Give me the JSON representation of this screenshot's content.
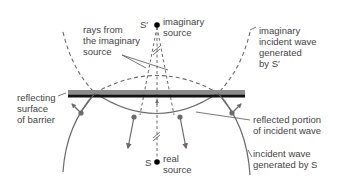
{
  "diagram": {
    "colors": {
      "line": "#6b6b6b",
      "barrier_top": "#8a8a8a",
      "barrier_bottom": "#111111",
      "source_dot": "#000000",
      "text": "#444444"
    },
    "sources": {
      "imaginary": {
        "symbol": "S′",
        "label": "imaginary\nsource"
      },
      "real": {
        "symbol": "S",
        "label": "real\nsource"
      }
    },
    "labels": {
      "rays_from_imaginary_source": "rays from\nthe imaginary\nsource",
      "imaginary_incident_wave": "imaginary\nincident wave\ngenerated\nby S′",
      "reflecting_surface": "reflecting\nsurface\nof barrier",
      "reflected_portion": "reflected portion\nof incident wave",
      "incident_wave": "incident wave\ngenerated by S"
    }
  }
}
